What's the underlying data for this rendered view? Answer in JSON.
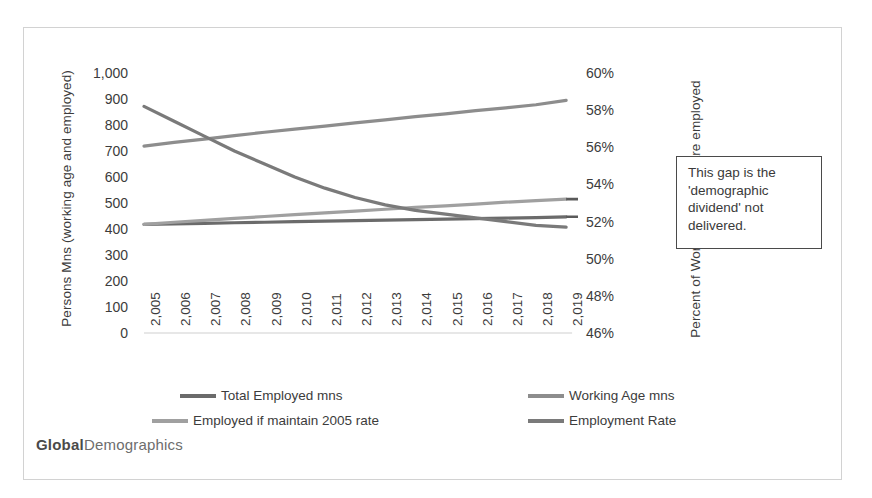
{
  "chart_data": {
    "type": "line",
    "title": "",
    "xlabel": "",
    "ylabel": "Persons Mns (working age and employed)",
    "y2label": "Percent of Working Age that are employed",
    "grid": false,
    "legend_position": "bottom",
    "x": [
      "2,005",
      "2,006",
      "2,007",
      "2,008",
      "2,009",
      "2,010",
      "2,011",
      "2,012",
      "2,013",
      "2,014",
      "2,015",
      "2,016",
      "2,017",
      "2,018",
      "2,019"
    ],
    "x_tick_labels": [
      "2,005",
      "2,006",
      "2,007",
      "2,008",
      "2,009",
      "2,010",
      "2,011",
      "2,012",
      "2,013",
      "2,014",
      "2,015",
      "2,016",
      "2,017",
      "2,018",
      "2,019"
    ],
    "ylim": [
      0,
      1000
    ],
    "y_ticks": [
      "0",
      "100",
      "200",
      "300",
      "400",
      "500",
      "600",
      "700",
      "800",
      "900",
      "1,000"
    ],
    "y_tick_values": [
      0,
      100,
      200,
      300,
      400,
      500,
      600,
      700,
      800,
      900,
      1000
    ],
    "y2lim": [
      46,
      60
    ],
    "y2_ticks": [
      "46%",
      "48%",
      "50%",
      "52%",
      "54%",
      "56%",
      "58%",
      "60%"
    ],
    "y2_tick_values": [
      46,
      48,
      50,
      52,
      54,
      56,
      58,
      60
    ],
    "series": [
      {
        "name": "Total Employed mns",
        "axis": "left",
        "color": "#6b6b6b",
        "values": [
          418,
          420,
          422,
          424,
          426,
          428,
          430,
          432,
          434,
          436,
          438,
          440,
          442,
          444,
          447
        ]
      },
      {
        "name": "Working Age mns",
        "axis": "left",
        "color": "#8d8d8d",
        "values": [
          719,
          733,
          746,
          759,
          772,
          784,
          796,
          808,
          820,
          832,
          843,
          855,
          866,
          878,
          895
        ]
      },
      {
        "name": "Employed if maintain 2005 rate",
        "axis": "left",
        "color": "#a0a0a0",
        "values": [
          418,
          426,
          433,
          441,
          448,
          455,
          462,
          469,
          476,
          483,
          489,
          496,
          503,
          509,
          515
        ]
      },
      {
        "name": "Employment Rate",
        "axis": "right",
        "color": "#7a7a7a",
        "values": [
          58.2,
          57.4,
          56.6,
          55.8,
          55.1,
          54.4,
          53.8,
          53.3,
          52.9,
          52.6,
          52.4,
          52.2,
          52.0,
          51.8,
          51.7
        ]
      }
    ],
    "annotations": [
      {
        "name": "demographic-dividend-callout",
        "text": "This gap is the 'demographic dividend' not delivered.",
        "lines": [
          "This gap is the",
          "'demographic",
          "dividend' not",
          "delivered."
        ]
      }
    ]
  },
  "legend": {
    "items": [
      {
        "label": "Total Employed mns",
        "color": "#6b6b6b"
      },
      {
        "label": "Working Age mns",
        "color": "#8d8d8d"
      },
      {
        "label": "Employed if maintain 2005 rate",
        "color": "#a0a0a0"
      },
      {
        "label": "Employment Rate",
        "color": "#7a7a7a"
      }
    ]
  },
  "axes": {
    "left": {
      "title": "Persons Mns (working age and employed)",
      "ticks": [
        "1,000",
        "900",
        "800",
        "700",
        "600",
        "500",
        "400",
        "300",
        "200",
        "100",
        "0"
      ]
    },
    "right": {
      "title": "Percent of Working Age that are employed",
      "ticks": [
        "60%",
        "58%",
        "56%",
        "54%",
        "52%",
        "50%",
        "48%",
        "46%"
      ]
    }
  },
  "callout": {
    "line1": "This gap is the",
    "line2": "'demographic",
    "line3": "dividend' not",
    "line4": "delivered."
  },
  "watermark": {
    "bold": "Global",
    "light": "Demographics"
  }
}
